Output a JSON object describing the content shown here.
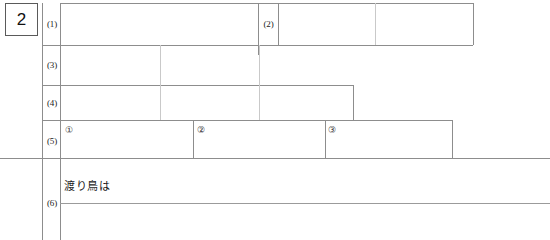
{
  "sheet": {
    "question_number": "2",
    "paper_color": "#ffffff",
    "rule_color": "#8d8d8d",
    "faint_rule_color": "#c9c9c9",
    "ink_color": "#1a1a1a"
  },
  "rows": [
    {
      "id": "row-1",
      "label": "(1)",
      "sub_label": "(2)",
      "cells": [
        "",
        "",
        ""
      ]
    },
    {
      "id": "row-3",
      "label": "(3)",
      "cells": [
        "",
        "",
        ""
      ]
    },
    {
      "id": "row-4",
      "label": "(4)",
      "cells": [
        "",
        "",
        ""
      ]
    },
    {
      "id": "row-5",
      "label": "(5)",
      "markers": [
        "①",
        "②",
        "③"
      ],
      "cells": [
        "",
        "",
        ""
      ]
    },
    {
      "id": "row-6",
      "label": "(6)",
      "seed_text": "渡り鳥は",
      "cells": [
        "",
        ""
      ]
    }
  ]
}
